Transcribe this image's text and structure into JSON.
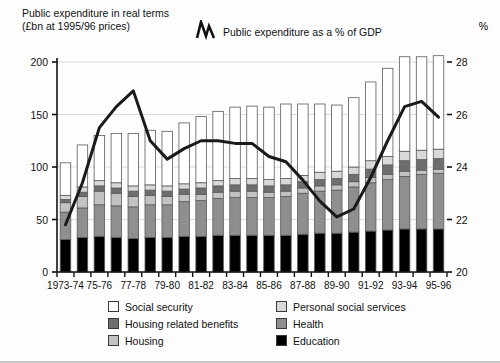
{
  "title": {
    "line1": "Public expenditure in real terms",
    "line2": "(£bn at 1995/96 prices)"
  },
  "line_series_legend": {
    "label": "Public expenditure as a % of GDP",
    "icon": "zigzag-line-icon"
  },
  "right_axis_unit": "%",
  "legend": {
    "items": [
      {
        "label": "Social security",
        "color": "#ffffff",
        "key": "social_security"
      },
      {
        "label": "Personal social services",
        "color": "#d9d9d9",
        "key": "personal_social_services"
      },
      {
        "label": "Housing related benefits",
        "color": "#6e6e6e",
        "key": "housing_related_benefits"
      },
      {
        "label": "Health",
        "color": "#8f8f8f",
        "key": "health"
      },
      {
        "label": "Housing",
        "color": "#c2c2c2",
        "key": "housing"
      },
      {
        "label": "Education",
        "color": "#000000",
        "key": "education"
      }
    ]
  },
  "chart_data": {
    "type": "bar",
    "subtype": "stacked-bar-with-line-overlay",
    "title": "Public expenditure in real terms (£bn at 1995/96 prices)",
    "xlabel": "",
    "ylabel": "£bn at 1995/96 prices",
    "y2label": "%",
    "ylim": [
      0,
      200
    ],
    "y2lim": [
      20,
      28
    ],
    "yticks": [
      0,
      50,
      100,
      150,
      200
    ],
    "y2ticks": [
      20,
      22,
      24,
      26,
      28
    ],
    "grid": "horizontal",
    "legend_position": "below-plot",
    "categories": [
      "1973-74",
      "1974-75",
      "1975-76",
      "1976-77",
      "1977-78",
      "1978-79",
      "1979-80",
      "1980-81",
      "1981-82",
      "1982-83",
      "1983-84",
      "1984-85",
      "1985-86",
      "1986-87",
      "1987-88",
      "1988-89",
      "1989-90",
      "1990-91",
      "1991-92",
      "1992-93",
      "1993-94",
      "1994-95",
      "1995-96"
    ],
    "tick_labels": [
      "1973-74",
      "",
      "75-76",
      "",
      "77-78",
      "",
      "79-80",
      "",
      "81-82",
      "",
      "83-84",
      "",
      "85-86",
      "",
      "87-88",
      "",
      "89-90",
      "",
      "91-92",
      "",
      "93-94",
      "",
      "95-96"
    ],
    "series": [
      {
        "name": "Education",
        "color": "#000000",
        "values": [
          31,
          33,
          34,
          33,
          32,
          33,
          33,
          34,
          34,
          35,
          35,
          35,
          35,
          35,
          36,
          37,
          37,
          38,
          39,
          40,
          41,
          41,
          41
        ]
      },
      {
        "name": "Health",
        "color": "#8f8f8f",
        "values": [
          26,
          28,
          30,
          30,
          30,
          31,
          31,
          33,
          34,
          35,
          36,
          36,
          36,
          37,
          39,
          40,
          41,
          43,
          46,
          48,
          50,
          52,
          53
        ]
      },
      {
        "name": "Housing",
        "color": "#c2c2c2",
        "values": [
          9,
          11,
          13,
          12,
          10,
          9,
          8,
          7,
          6,
          6,
          6,
          6,
          5,
          5,
          5,
          5,
          5,
          5,
          5,
          5,
          5,
          4,
          4
        ]
      },
      {
        "name": "Housing related benefits",
        "color": "#6e6e6e",
        "values": [
          3,
          4,
          5,
          5,
          5,
          5,
          5,
          5,
          6,
          6,
          6,
          6,
          6,
          6,
          6,
          6,
          6,
          7,
          8,
          9,
          10,
          10,
          10
        ]
      },
      {
        "name": "Personal social services",
        "color": "#d9d9d9",
        "values": [
          4,
          5,
          5,
          5,
          5,
          5,
          5,
          5,
          5,
          5,
          6,
          6,
          6,
          6,
          6,
          7,
          7,
          7,
          8,
          8,
          9,
          9,
          9
        ]
      },
      {
        "name": "Social security",
        "color": "#ffffff",
        "values": [
          31,
          40,
          43,
          47,
          50,
          52,
          52,
          58,
          63,
          66,
          68,
          69,
          69,
          71,
          68,
          65,
          63,
          66,
          75,
          84,
          90,
          89,
          89
        ]
      }
    ],
    "overlay_line": {
      "name": "Public expenditure as a % of GDP",
      "color": "#1a1a1a",
      "axis": "right",
      "unit": "%",
      "values": [
        21.8,
        23.4,
        25.5,
        26.3,
        26.9,
        25.0,
        24.3,
        24.7,
        25.0,
        25.0,
        24.9,
        24.9,
        24.4,
        24.2,
        23.5,
        22.7,
        22.1,
        22.4,
        23.6,
        25.0,
        26.3,
        26.5,
        25.9
      ]
    }
  }
}
